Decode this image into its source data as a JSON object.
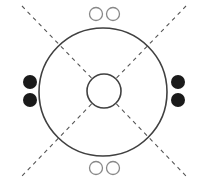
{
  "diagram": {
    "colors": {
      "stroke": "#404040",
      "dash": "#555555",
      "filled_seat": "#1a1a1a",
      "empty_seat": "#888888",
      "background": "#ffffff"
    },
    "outer_circle": {
      "cx": 103,
      "cy": 92,
      "r": 64
    },
    "inner_circle": {
      "cx": 104,
      "cy": 91,
      "r": 17
    },
    "dashed_lines": [
      {
        "x1": 22,
        "y1": 6,
        "x2": 186,
        "y2": 176
      },
      {
        "x1": 186,
        "y1": 6,
        "x2": 22,
        "y2": 176
      }
    ],
    "seats": [
      {
        "position": "top-left",
        "cx": 96,
        "cy": 14,
        "r": 6.5,
        "filled": false
      },
      {
        "position": "top-right",
        "cx": 113,
        "cy": 14,
        "r": 6.5,
        "filled": false
      },
      {
        "position": "bottom-left",
        "cx": 96,
        "cy": 168,
        "r": 6.5,
        "filled": false
      },
      {
        "position": "bottom-right",
        "cx": 113,
        "cy": 168,
        "r": 6.5,
        "filled": false
      },
      {
        "position": "left-top",
        "cx": 30,
        "cy": 82,
        "r": 7,
        "filled": true
      },
      {
        "position": "left-bottom",
        "cx": 30,
        "cy": 100,
        "r": 7,
        "filled": true
      },
      {
        "position": "right-top",
        "cx": 178,
        "cy": 82,
        "r": 7,
        "filled": true
      },
      {
        "position": "right-bottom",
        "cx": 178,
        "cy": 100,
        "r": 7,
        "filled": true
      }
    ]
  }
}
